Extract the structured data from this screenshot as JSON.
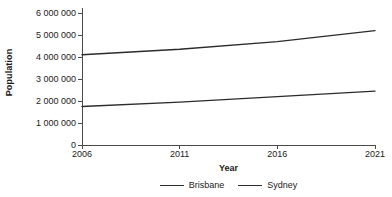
{
  "chart_data": {
    "type": "line",
    "title": "",
    "xlabel": "Year",
    "ylabel": "Population",
    "x": [
      2006,
      2011,
      2016,
      2021
    ],
    "categories": [
      "2006",
      "2011",
      "2016",
      "2021"
    ],
    "series": [
      {
        "name": "Sydney",
        "values": [
          4100000,
          4350000,
          4700000,
          5200000
        ],
        "color": "#2b2b2b"
      },
      {
        "name": "Brisbane",
        "values": [
          1750000,
          1950000,
          2200000,
          2450000
        ],
        "color": "#2b2b2b"
      }
    ],
    "xlim": [
      2006,
      2021
    ],
    "ylim": [
      0,
      6000000
    ],
    "xticks": [
      2006,
      2011,
      2016,
      2021
    ],
    "yticks": [
      0,
      1000000,
      2000000,
      3000000,
      4000000,
      5000000,
      6000000
    ],
    "ytick_labels": [
      "0",
      "1 000 000",
      "2 000 000",
      "3 000 000",
      "4 000 000",
      "5 000 000",
      "6 000 000"
    ],
    "xtick_labels": [
      "2006",
      "2011",
      "2016",
      "2021"
    ],
    "grid": false,
    "legend_position": "bottom",
    "legend_entries": [
      "Brisbane",
      "Sydney"
    ]
  },
  "axes": {
    "y_title": "Population",
    "x_title": "Year"
  },
  "legend": {
    "items": [
      {
        "label": "Brisbane"
      },
      {
        "label": "Sydney"
      }
    ]
  },
  "colors": {
    "line": "#2b2b2b",
    "axis": "#4a4a4a",
    "text": "#1a1a1a",
    "background": "#ffffff"
  }
}
